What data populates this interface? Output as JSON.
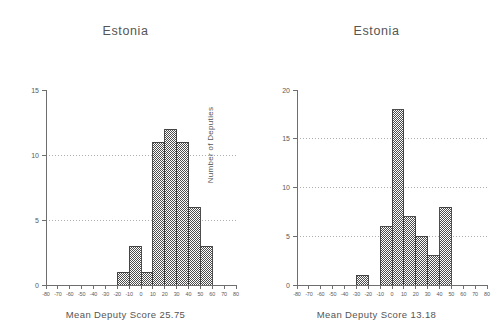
{
  "figure": {
    "background_color": "#ffffff",
    "bar_fill_color": "#8c8c8c",
    "bar_edge_color": "#3a3a3a",
    "axis_color": "#6e6e6e",
    "grid_color": "#9a9a9a",
    "text_color": "#555555"
  },
  "panels": [
    {
      "id": "left",
      "title": "Estonia",
      "caption": "Mean Deputy Score 25.75",
      "ylabel": "Number of Deputies",
      "xlabel": "",
      "xticks": [
        "-80",
        "-70",
        "-60",
        "-50",
        "-40",
        "-30",
        "-20",
        "-10",
        "0",
        "10",
        "20",
        "30",
        "40",
        "50",
        "60",
        "70",
        "80"
      ],
      "yticks": [
        "0",
        "5",
        "10",
        "15"
      ],
      "gridlines_at": [
        "5",
        "10"
      ],
      "mean_deputy_score": "25.75"
    },
    {
      "id": "right",
      "title": "Estonia",
      "caption": "Mean Deputy Score 13.18",
      "ylabel": "Number of Deputies",
      "xlabel": "",
      "xticks": [
        "-80",
        "-70",
        "-60",
        "-50",
        "-40",
        "-30",
        "-20",
        "-10",
        "0",
        "10",
        "20",
        "30",
        "40",
        "50",
        "60",
        "70",
        "80"
      ],
      "yticks": [
        "0",
        "5",
        "10",
        "15",
        "20"
      ],
      "gridlines_at": [
        "5",
        "10",
        "15"
      ],
      "mean_deputy_score": "13.18"
    }
  ],
  "chart_data": [
    {
      "type": "bar",
      "title": "Estonia",
      "subtitle": "Mean Deputy Score 25.75",
      "xlabel": "Mean Deputy Score 25.75",
      "ylabel": "Number of Deputies",
      "xlim": [
        -80,
        80
      ],
      "ylim": [
        0,
        15
      ],
      "xtick_step": 10,
      "ytick_step": 5,
      "grid": "horizontal-dotted",
      "legend": "none",
      "bin_width": 10,
      "bin_edges": [
        -20,
        -10,
        0,
        10,
        20,
        30,
        40,
        50,
        60
      ],
      "categories": [
        "-20 to -10",
        "-10 to 0",
        "0 to 10",
        "10 to 20",
        "20 to 30",
        "30 to 40",
        "40 to 50",
        "50 to 60"
      ],
      "values": [
        1,
        3,
        1,
        11,
        12,
        11,
        6,
        3
      ],
      "annotations": [
        "Mean Deputy Score 25.75"
      ]
    },
    {
      "type": "bar",
      "title": "Estonia",
      "subtitle": "Mean Deputy Score 13.18",
      "xlabel": "Mean Deputy Score 13.18",
      "ylabel": "Number of Deputies",
      "xlim": [
        -80,
        80
      ],
      "ylim": [
        0,
        20
      ],
      "xtick_step": 10,
      "ytick_step": 5,
      "grid": "horizontal-dotted",
      "legend": "none",
      "bin_width": 10,
      "bin_edges": [
        -30,
        -20,
        -10,
        0,
        10,
        20,
        30,
        40,
        50
      ],
      "categories": [
        "-30 to -20",
        "-20 to -10",
        "-10 to 0",
        "0 to 10",
        "10 to 20",
        "20 to 30",
        "30 to 40",
        "40 to 50"
      ],
      "values": [
        1,
        0,
        6,
        18,
        7,
        5,
        3,
        8
      ],
      "annotations": [
        "Mean Deputy Score 13.18"
      ]
    }
  ]
}
